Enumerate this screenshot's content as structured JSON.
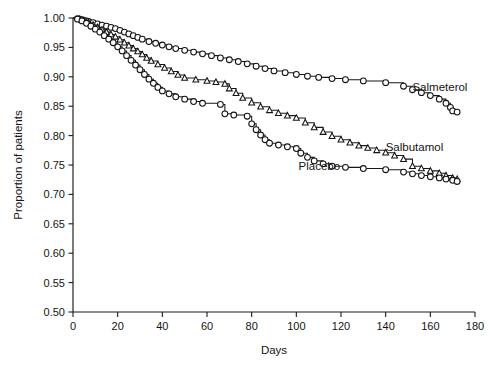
{
  "chart_data": {
    "type": "line",
    "title": "",
    "xlabel": "Days",
    "ylabel": "Proportion of patients",
    "xlim": [
      0,
      180
    ],
    "ylim": [
      0.5,
      1.0
    ],
    "xticks": [
      0,
      20,
      40,
      60,
      80,
      100,
      120,
      140,
      160,
      180
    ],
    "xtick_labels": [
      "0",
      "20",
      "40",
      "60",
      "80",
      "100",
      "120",
      "140",
      "160",
      "180"
    ],
    "yticks": [
      0.5,
      0.55,
      0.6,
      0.65,
      0.7,
      0.75,
      0.8,
      0.85,
      0.9,
      0.95,
      1.0
    ],
    "ytick_labels": [
      "0.50",
      "0.55",
      "0.60",
      "0.65",
      "0.70",
      "0.75",
      "0.80",
      "0.85",
      "0.90",
      "0.95",
      "1.00"
    ],
    "grid": false,
    "legend_position": "inline-annotations",
    "series": [
      {
        "name": "Salmeterol",
        "marker": "circle",
        "label_text": "Salmeterol",
        "label_x": 152,
        "label_y": 0.876,
        "points": [
          [
            0,
            1.0
          ],
          [
            2,
            0.999
          ],
          [
            3,
            0.998
          ],
          [
            4,
            0.997
          ],
          [
            5,
            0.996
          ],
          [
            6,
            0.995
          ],
          [
            7,
            0.994
          ],
          [
            9,
            0.992
          ],
          [
            11,
            0.99
          ],
          [
            13,
            0.988
          ],
          [
            15,
            0.986
          ],
          [
            17,
            0.984
          ],
          [
            19,
            0.982
          ],
          [
            21,
            0.979
          ],
          [
            23,
            0.976
          ],
          [
            25,
            0.973
          ],
          [
            27,
            0.97
          ],
          [
            29,
            0.967
          ],
          [
            31,
            0.964
          ],
          [
            34,
            0.96
          ],
          [
            37,
            0.957
          ],
          [
            40,
            0.954
          ],
          [
            43,
            0.951
          ],
          [
            46,
            0.948
          ],
          [
            50,
            0.945
          ],
          [
            54,
            0.942
          ],
          [
            58,
            0.939
          ],
          [
            62,
            0.936
          ],
          [
            66,
            0.932
          ],
          [
            70,
            0.929
          ],
          [
            74,
            0.926
          ],
          [
            78,
            0.922
          ],
          [
            82,
            0.918
          ],
          [
            86,
            0.914
          ],
          [
            90,
            0.91
          ],
          [
            95,
            0.907
          ],
          [
            100,
            0.904
          ],
          [
            105,
            0.901
          ],
          [
            110,
            0.899
          ],
          [
            116,
            0.897
          ],
          [
            122,
            0.895
          ],
          [
            130,
            0.893
          ],
          [
            140,
            0.89
          ],
          [
            148,
            0.884
          ],
          [
            152,
            0.878
          ],
          [
            156,
            0.873
          ],
          [
            160,
            0.868
          ],
          [
            164,
            0.862
          ],
          [
            167,
            0.855
          ],
          [
            169,
            0.848
          ],
          [
            170,
            0.842
          ],
          [
            172,
            0.84
          ]
        ]
      },
      {
        "name": "Salbutamol",
        "marker": "triangle",
        "label_text": "Salbutamol",
        "label_x": 140,
        "label_y": 0.773,
        "points": [
          [
            0,
            1.0
          ],
          [
            3,
            0.998
          ],
          [
            5,
            0.995
          ],
          [
            7,
            0.992
          ],
          [
            9,
            0.988
          ],
          [
            11,
            0.984
          ],
          [
            13,
            0.98
          ],
          [
            15,
            0.976
          ],
          [
            17,
            0.972
          ],
          [
            19,
            0.968
          ],
          [
            21,
            0.963
          ],
          [
            23,
            0.958
          ],
          [
            25,
            0.953
          ],
          [
            27,
            0.948
          ],
          [
            29,
            0.943
          ],
          [
            31,
            0.938
          ],
          [
            33,
            0.932
          ],
          [
            35,
            0.927
          ],
          [
            38,
            0.921
          ],
          [
            41,
            0.915
          ],
          [
            44,
            0.909
          ],
          [
            47,
            0.903
          ],
          [
            50,
            0.898
          ],
          [
            55,
            0.895
          ],
          [
            60,
            0.893
          ],
          [
            64,
            0.891
          ],
          [
            68,
            0.888
          ],
          [
            70,
            0.88
          ],
          [
            73,
            0.872
          ],
          [
            76,
            0.864
          ],
          [
            80,
            0.856
          ],
          [
            84,
            0.849
          ],
          [
            88,
            0.843
          ],
          [
            92,
            0.838
          ],
          [
            96,
            0.834
          ],
          [
            100,
            0.83
          ],
          [
            104,
            0.822
          ],
          [
            108,
            0.814
          ],
          [
            112,
            0.806
          ],
          [
            116,
            0.799
          ],
          [
            120,
            0.793
          ],
          [
            124,
            0.788
          ],
          [
            128,
            0.783
          ],
          [
            132,
            0.779
          ],
          [
            136,
            0.775
          ],
          [
            140,
            0.771
          ],
          [
            144,
            0.766
          ],
          [
            148,
            0.76
          ],
          [
            152,
            0.748
          ],
          [
            156,
            0.744
          ],
          [
            160,
            0.74
          ],
          [
            164,
            0.736
          ],
          [
            167,
            0.732
          ],
          [
            170,
            0.728
          ],
          [
            172,
            0.726
          ]
        ]
      },
      {
        "name": "Placebo",
        "marker": "circle",
        "label_text": "Placebo",
        "label_x": 101,
        "label_y": 0.742,
        "points": [
          [
            0,
            1.0
          ],
          [
            2,
            0.998
          ],
          [
            4,
            0.995
          ],
          [
            6,
            0.991
          ],
          [
            8,
            0.986
          ],
          [
            10,
            0.981
          ],
          [
            12,
            0.976
          ],
          [
            14,
            0.97
          ],
          [
            16,
            0.964
          ],
          [
            18,
            0.958
          ],
          [
            20,
            0.951
          ],
          [
            22,
            0.944
          ],
          [
            24,
            0.936
          ],
          [
            26,
            0.928
          ],
          [
            28,
            0.92
          ],
          [
            30,
            0.912
          ],
          [
            32,
            0.904
          ],
          [
            34,
            0.896
          ],
          [
            36,
            0.889
          ],
          [
            38,
            0.882
          ],
          [
            40,
            0.876
          ],
          [
            43,
            0.871
          ],
          [
            46,
            0.866
          ],
          [
            50,
            0.862
          ],
          [
            54,
            0.858
          ],
          [
            58,
            0.855
          ],
          [
            66,
            0.853
          ],
          [
            68,
            0.837
          ],
          [
            72,
            0.835
          ],
          [
            78,
            0.833
          ],
          [
            80,
            0.82
          ],
          [
            82,
            0.81
          ],
          [
            84,
            0.801
          ],
          [
            86,
            0.793
          ],
          [
            88,
            0.787
          ],
          [
            92,
            0.784
          ],
          [
            96,
            0.781
          ],
          [
            100,
            0.778
          ],
          [
            102,
            0.77
          ],
          [
            105,
            0.763
          ],
          [
            108,
            0.757
          ],
          [
            112,
            0.752
          ],
          [
            116,
            0.748
          ],
          [
            122,
            0.746
          ],
          [
            130,
            0.744
          ],
          [
            140,
            0.742
          ],
          [
            148,
            0.738
          ],
          [
            152,
            0.735
          ],
          [
            156,
            0.732
          ],
          [
            160,
            0.73
          ],
          [
            164,
            0.728
          ],
          [
            167,
            0.726
          ],
          [
            170,
            0.724
          ],
          [
            172,
            0.722
          ]
        ]
      }
    ]
  }
}
